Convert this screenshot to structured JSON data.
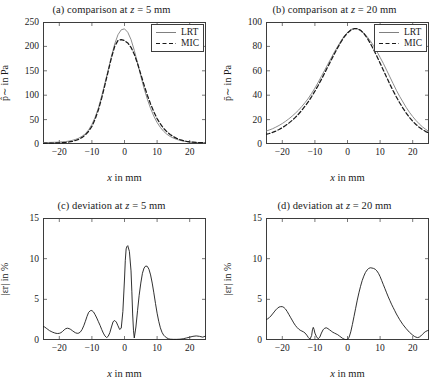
{
  "figure": {
    "panel_count": 4,
    "background": "#ffffff",
    "axis_color": "#3d3d3d",
    "lrt_color": "#808080",
    "mic_color": "#1a1a1a"
  },
  "panels": [
    {
      "id": "a",
      "title": "(a) comparison at z = 5 mm",
      "title_prefix": "(a) comparison at ",
      "title_var": "z",
      "title_eq": " = 5 mm",
      "xlabel_var": "x",
      "xlabel_rest": " in mm",
      "ylabel": "p̂∼ in Pa",
      "legend": [
        "LRT",
        "MIC"
      ],
      "xticks": [
        "-20",
        "-10",
        "0",
        "10",
        "20"
      ],
      "yticks": [
        "0",
        "50",
        "100",
        "150",
        "200",
        "250"
      ]
    },
    {
      "id": "b",
      "title": "(b) comparison at z = 20 mm",
      "title_prefix": "(b) comparison at ",
      "title_var": "z",
      "title_eq": " = 20 mm",
      "xlabel_var": "x",
      "xlabel_rest": " in mm",
      "ylabel": "p̄∼ in Pa",
      "legend": [
        "LRT",
        "MIC"
      ],
      "xticks": [
        "-20",
        "-10",
        "0",
        "10",
        "20"
      ],
      "yticks": [
        "0",
        "20",
        "40",
        "60",
        "80",
        "100"
      ]
    },
    {
      "id": "c",
      "title": "(c) deviation at z = 5 mm",
      "title_prefix": "(c) deviation at ",
      "title_var": "z",
      "title_eq": " = 5 mm",
      "xlabel_var": "x",
      "xlabel_rest": " in mm",
      "ylabel": "|εr| in %",
      "xticks": [
        "-20",
        "-10",
        "0",
        "10",
        "20"
      ],
      "yticks": [
        "0",
        "5",
        "10",
        "15"
      ]
    },
    {
      "id": "d",
      "title": "(d) deviation at z = 20 mm",
      "title_prefix": "(d) deviation at ",
      "title_var": "z",
      "title_eq": " = 20 mm",
      "xlabel_var": "x",
      "xlabel_rest": " in mm",
      "ylabel": "|εr| in %",
      "xticks": [
        "-20",
        "-10",
        "0",
        "10",
        "20"
      ],
      "yticks": [
        "0",
        "5",
        "10",
        "15"
      ]
    }
  ],
  "chart_data": [
    {
      "type": "line",
      "panel": "a",
      "title": "(a) comparison at z = 5 mm",
      "xlabel": "x in mm",
      "ylabel": "p̂~ in Pa",
      "xlim": [
        -25,
        25
      ],
      "ylim": [
        0,
        250
      ],
      "xticks": [
        -20,
        -10,
        0,
        10,
        20
      ],
      "yticks": [
        0,
        50,
        100,
        150,
        200,
        250
      ],
      "grid": false,
      "legend": [
        "LRT",
        "MIC"
      ],
      "legend_position": "top-right",
      "x": [
        -25,
        -24,
        -23,
        -22,
        -21,
        -20,
        -19,
        -18,
        -17,
        -16,
        -15,
        -14,
        -13,
        -12,
        -11,
        -10,
        -9,
        -8,
        -7,
        -6,
        -5,
        -4,
        -3,
        -2,
        -1,
        0,
        1,
        2,
        3,
        4,
        5,
        6,
        7,
        8,
        9,
        10,
        11,
        12,
        13,
        14,
        15,
        16,
        17,
        18,
        19,
        20,
        21,
        22,
        23,
        24,
        25
      ],
      "series": [
        {
          "name": "LRT",
          "style": "solid",
          "color": "#808080",
          "values": [
            3,
            3,
            3.2,
            3.4,
            3.6,
            4,
            4.5,
            5,
            6,
            7.5,
            9.5,
            12,
            16,
            21,
            29,
            40,
            55,
            74,
            98,
            125,
            152,
            180,
            205,
            224,
            234,
            236,
            229,
            214,
            192,
            166,
            139,
            114,
            92,
            73,
            57,
            44,
            34,
            26,
            20,
            15.5,
            12,
            9.5,
            7.5,
            6,
            5,
            4,
            3.4,
            3,
            2.7,
            2.5,
            2.4
          ]
        },
        {
          "name": "MIC",
          "style": "dashed",
          "color": "#1a1a1a",
          "values": [
            1.5,
            1.6,
            1.7,
            1.9,
            2.1,
            2.4,
            2.8,
            3.4,
            4.2,
            5.4,
            7.2,
            9.8,
            13.5,
            18.5,
            26,
            36,
            51,
            70,
            94,
            121,
            149,
            177,
            200,
            212,
            214,
            212,
            207,
            198,
            184,
            165,
            143,
            121,
            100,
            82,
            66,
            52,
            41,
            32,
            25,
            19.5,
            15,
            11.5,
            9,
            7,
            5.6,
            4.5,
            3.8,
            3.2,
            2.8,
            2.6,
            2.5
          ]
        }
      ]
    },
    {
      "type": "line",
      "panel": "b",
      "title": "(b) comparison at z = 20 mm",
      "xlabel": "x in mm",
      "ylabel": "p̄~ in Pa",
      "xlim": [
        -25,
        25
      ],
      "ylim": [
        0,
        100
      ],
      "xticks": [
        -20,
        -10,
        0,
        10,
        20
      ],
      "yticks": [
        0,
        20,
        40,
        60,
        80,
        100
      ],
      "grid": false,
      "legend": [
        "LRT",
        "MIC"
      ],
      "legend_position": "top-right",
      "x": [
        -25,
        -24,
        -23,
        -22,
        -21,
        -20,
        -19,
        -18,
        -17,
        -16,
        -15,
        -14,
        -13,
        -12,
        -11,
        -10,
        -9,
        -8,
        -7,
        -6,
        -5,
        -4,
        -3,
        -2,
        -1,
        0,
        1,
        2,
        3,
        4,
        5,
        6,
        7,
        8,
        9,
        10,
        11,
        12,
        13,
        14,
        15,
        16,
        17,
        18,
        19,
        20,
        21,
        22,
        23,
        24,
        25
      ],
      "series": [
        {
          "name": "LRT",
          "style": "solid",
          "color": "#808080",
          "values": [
            10.5,
            11.5,
            12.5,
            13.8,
            15.2,
            16.8,
            18.6,
            20.6,
            22.8,
            25.2,
            27.8,
            30.8,
            34,
            37.5,
            41.5,
            45.8,
            50.5,
            55.5,
            60.5,
            65.5,
            70.5,
            75.5,
            80,
            84.5,
            88.5,
            91.5,
            93.8,
            94.6,
            94.4,
            93.2,
            91,
            88,
            84.5,
            80.5,
            76,
            71,
            66,
            60.5,
            55,
            49.5,
            44,
            39,
            34.5,
            30,
            26,
            22.5,
            19.3,
            16.5,
            14,
            12,
            10.2
          ]
        },
        {
          "name": "MIC",
          "style": "dashed",
          "color": "#1a1a1a",
          "values": [
            7.8,
            8.6,
            9.5,
            10.6,
            11.9,
            13.4,
            15.1,
            17.1,
            19.3,
            21.8,
            24.6,
            27.7,
            31.1,
            34.8,
            38.9,
            43.3,
            48,
            53,
            58.2,
            63.5,
            68.8,
            74,
            79,
            83.6,
            87.8,
            91,
            93.3,
            94.5,
            94.5,
            93.2,
            90.6,
            87,
            82.5,
            77.5,
            72,
            66.3,
            60.5,
            54.7,
            49,
            43.6,
            38.5,
            33.8,
            29.4,
            25.4,
            21.8,
            18.7,
            16,
            13.7,
            11.8,
            10.2,
            9
          ]
        }
      ]
    },
    {
      "type": "line",
      "panel": "c",
      "title": "(c) deviation at z = 5 mm",
      "xlabel": "x in mm",
      "ylabel": "|e_r| in %",
      "xlim": [
        -25,
        25
      ],
      "ylim": [
        0,
        15
      ],
      "xticks": [
        -20,
        -10,
        0,
        10,
        20
      ],
      "yticks": [
        0,
        5,
        10,
        15
      ],
      "grid": false,
      "x": [
        -25,
        -24.5,
        -24,
        -23.5,
        -23,
        -22.5,
        -22,
        -21.5,
        -21,
        -20.5,
        -20,
        -19.5,
        -19,
        -18.5,
        -18,
        -17.5,
        -17,
        -16.5,
        -16,
        -15.5,
        -15,
        -14.5,
        -14,
        -13.5,
        -13,
        -12.5,
        -12,
        -11.5,
        -11,
        -10.5,
        -10,
        -9.5,
        -9,
        -8.5,
        -8,
        -7.5,
        -7,
        -6.5,
        -6,
        -5.5,
        -5,
        -4.5,
        -4,
        -3.5,
        -3,
        -2.5,
        -2,
        -1.5,
        -1,
        -0.5,
        0,
        0.25,
        0.5,
        0.75,
        1,
        1.5,
        2,
        2.25,
        2.5,
        2.75,
        3,
        3.5,
        4,
        4.5,
        5,
        5.5,
        6,
        6.5,
        7,
        7.5,
        8,
        8.5,
        9,
        9.5,
        10,
        10.5,
        11,
        11.5,
        12,
        12.5,
        13,
        13.5,
        14,
        15,
        16,
        17,
        18,
        19,
        20,
        21,
        22,
        23,
        24,
        25
      ],
      "series": [
        {
          "name": "relative deviation",
          "style": "solid",
          "color": "#1a1a1a",
          "values": [
            1.65,
            1.6,
            1.45,
            1.3,
            1.15,
            1.05,
            0.95,
            0.88,
            0.82,
            0.8,
            0.82,
            0.9,
            1.05,
            1.25,
            1.4,
            1.45,
            1.4,
            1.3,
            1.15,
            1.0,
            0.88,
            0.82,
            0.85,
            1.0,
            1.3,
            1.75,
            2.3,
            2.9,
            3.4,
            3.6,
            3.62,
            3.45,
            3.1,
            2.7,
            2.25,
            1.8,
            1.3,
            0.85,
            0.5,
            0.3,
            0.45,
            0.9,
            1.6,
            2.25,
            2.4,
            2.2,
            1.75,
            1.3,
            1.45,
            3.5,
            7.5,
            9.8,
            11.2,
            11.5,
            11.6,
            10.9,
            8.5,
            6.0,
            3.2,
            1.2,
            0.25,
            1.6,
            3.6,
            5.5,
            7.0,
            8.2,
            8.85,
            9.1,
            9.05,
            8.7,
            8.0,
            7.0,
            5.8,
            4.5,
            3.3,
            2.3,
            1.5,
            0.95,
            0.6,
            0.4,
            0.25,
            0.15,
            0.1,
            0.08,
            0.08,
            0.1,
            0.15,
            0.25,
            0.35,
            0.45,
            0.5,
            0.45,
            0.35,
            0.5,
            0.3
          ]
        }
      ]
    },
    {
      "type": "line",
      "panel": "d",
      "title": "(d) deviation at z = 20 mm",
      "xlabel": "x in mm",
      "ylabel": "|e_r| in %",
      "xlim": [
        -25,
        25
      ],
      "ylim": [
        0,
        15
      ],
      "xticks": [
        -20,
        -10,
        0,
        10,
        20
      ],
      "yticks": [
        0,
        5,
        10,
        15
      ],
      "grid": false,
      "x": [
        -25,
        -24.5,
        -24,
        -23.5,
        -23,
        -22.5,
        -22,
        -21.5,
        -21,
        -20.5,
        -20,
        -19.5,
        -19,
        -18.5,
        -18,
        -17.5,
        -17,
        -16.5,
        -16,
        -15.5,
        -15,
        -14.5,
        -14,
        -13.5,
        -13,
        -12.5,
        -12,
        -11.5,
        -11,
        -10.75,
        -10.5,
        -10.25,
        -10,
        -9.5,
        -9,
        -8.5,
        -8,
        -7.5,
        -7,
        -6.5,
        -6,
        -5.5,
        -5,
        -4.5,
        -4,
        -3.5,
        -3,
        -2.5,
        -2,
        -1.5,
        -1,
        -0.5,
        0,
        0.5,
        1,
        1.5,
        2,
        2.5,
        3,
        3.5,
        4,
        4.5,
        5,
        5.5,
        6,
        6.5,
        7,
        7.5,
        8,
        8.5,
        9,
        9.5,
        10,
        10.5,
        11,
        11.5,
        12,
        12.5,
        13,
        13.5,
        14,
        14.5,
        15,
        15.5,
        16,
        17,
        18,
        19,
        20,
        20.5,
        21,
        21.5,
        22,
        22.5,
        23,
        23.5,
        24,
        24.5,
        25
      ],
      "series": [
        {
          "name": "relative deviation",
          "style": "solid",
          "color": "#1a1a1a",
          "values": [
            2.5,
            2.6,
            2.75,
            2.95,
            3.2,
            3.45,
            3.7,
            3.9,
            4.05,
            4.1,
            4.1,
            4.0,
            3.8,
            3.5,
            3.15,
            2.8,
            2.45,
            2.1,
            1.8,
            1.55,
            1.35,
            1.2,
            1.1,
            1.0,
            0.85,
            0.6,
            0.3,
            0.1,
            0.55,
            1.25,
            1.55,
            1.3,
            0.85,
            0.4,
            0.15,
            0.35,
            0.85,
            1.25,
            1.45,
            1.5,
            1.4,
            1.25,
            1.1,
            0.95,
            0.85,
            0.75,
            0.65,
            0.5,
            0.35,
            0.2,
            0.1,
            0.05,
            0.05,
            0.35,
            1.0,
            1.9,
            2.9,
            3.9,
            4.9,
            5.8,
            6.6,
            7.3,
            7.85,
            8.3,
            8.6,
            8.8,
            8.88,
            8.85,
            8.8,
            8.7,
            8.5,
            8.2,
            7.8,
            7.3,
            6.8,
            6.3,
            5.8,
            5.3,
            4.85,
            4.4,
            4.0,
            3.6,
            3.2,
            2.85,
            2.5,
            1.9,
            1.4,
            0.95,
            0.6,
            0.45,
            0.35,
            0.3,
            0.35,
            0.5,
            0.7,
            0.9,
            1.05,
            1.15,
            1.2
          ]
        }
      ]
    }
  ]
}
